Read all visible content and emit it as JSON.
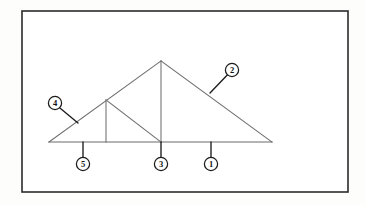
{
  "figure": {
    "canvas": {
      "width": 365,
      "height": 205
    },
    "colors": {
      "page_background": "#fdfdfc",
      "frame_stroke": "#2b2b2b",
      "member_stroke": "#6e6e6e",
      "leader_stroke": "#1c1c1c",
      "callout_fill": "#ffffff",
      "callout_text": "#111111"
    },
    "frame": {
      "x": 22,
      "y": 11,
      "width": 326,
      "height": 181
    },
    "nodes": {
      "left_eave": {
        "x": 49,
        "y": 142
      },
      "apex": {
        "x": 161,
        "y": 61
      },
      "right_eave": {
        "x": 272,
        "y": 142
      },
      "left_panel_point": {
        "x": 106,
        "y": 100
      },
      "base_left_post": {
        "x": 106,
        "y": 142
      },
      "base_center": {
        "x": 161,
        "y": 142
      }
    },
    "members": [
      {
        "name": "left-rafter",
        "x1": 49,
        "y1": 142,
        "x2": 161,
        "y2": 61
      },
      {
        "name": "right-rafter",
        "x1": 161,
        "y1": 61,
        "x2": 272,
        "y2": 142
      },
      {
        "name": "bottom-chord",
        "x1": 49,
        "y1": 142,
        "x2": 272,
        "y2": 142
      },
      {
        "name": "king-post",
        "x1": 161,
        "y1": 61,
        "x2": 161,
        "y2": 142
      },
      {
        "name": "left-strut-post",
        "x1": 106,
        "y1": 100,
        "x2": 106,
        "y2": 142
      },
      {
        "name": "left-diagonal-web",
        "x1": 106,
        "y1": 100,
        "x2": 161,
        "y2": 142
      }
    ],
    "callouts": [
      {
        "id": "callout-1",
        "label": "1",
        "circle": {
          "cx": 211,
          "cy": 164,
          "r": 6.6
        },
        "leader": {
          "x1": 211,
          "y1": 157.4,
          "x2": 211,
          "y2": 142
        },
        "points_to": "bottom-chord"
      },
      {
        "id": "callout-2",
        "label": "2",
        "circle": {
          "cx": 232,
          "cy": 70,
          "r": 6.6
        },
        "leader": {
          "x1": 227.5,
          "y1": 74.8,
          "x2": 210,
          "y2": 93
        },
        "points_to": "right-rafter"
      },
      {
        "id": "callout-3",
        "label": "3",
        "circle": {
          "cx": 161,
          "cy": 164,
          "r": 6.6
        },
        "leader": {
          "x1": 161,
          "y1": 157.4,
          "x2": 161,
          "y2": 142
        },
        "points_to": "base-center-node"
      },
      {
        "id": "callout-4",
        "label": "4",
        "circle": {
          "cx": 55,
          "cy": 103,
          "r": 6.6
        },
        "leader": {
          "x1": 59.6,
          "y1": 107.8,
          "x2": 78,
          "y2": 123
        },
        "points_to": "left-rafter"
      },
      {
        "id": "callout-5",
        "label": "5",
        "circle": {
          "cx": 83,
          "cy": 164,
          "r": 6.6
        },
        "leader": {
          "x1": 83,
          "y1": 157.4,
          "x2": 83,
          "y2": 142
        },
        "points_to": "bottom-chord"
      }
    ]
  }
}
